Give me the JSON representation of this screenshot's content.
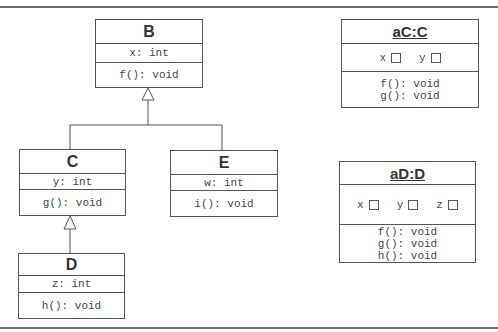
{
  "classes": {
    "B": {
      "name": "B",
      "attribute": "x: int",
      "method": "f(): void"
    },
    "C": {
      "name": "C",
      "attribute": "y: int",
      "method": "g(): void"
    },
    "D": {
      "name": "D",
      "attribute": "z: int",
      "method": "h(): void"
    },
    "E": {
      "name": "E",
      "attribute": "w: int",
      "method": "i(): void"
    }
  },
  "objects": {
    "aC": {
      "name": "aC:C",
      "slots": [
        "x",
        "y"
      ],
      "methods": [
        "f(): void",
        "g(): void"
      ]
    },
    "aD": {
      "name": "aD:D",
      "slots": [
        "x",
        "y",
        "z"
      ],
      "methods": [
        "f(): void",
        "g(): void",
        "h(): void"
      ]
    }
  },
  "relations": [
    {
      "type": "generalization",
      "from": "C",
      "to": "B"
    },
    {
      "type": "generalization",
      "from": "E",
      "to": "B"
    },
    {
      "type": "generalization",
      "from": "D",
      "to": "C"
    }
  ]
}
